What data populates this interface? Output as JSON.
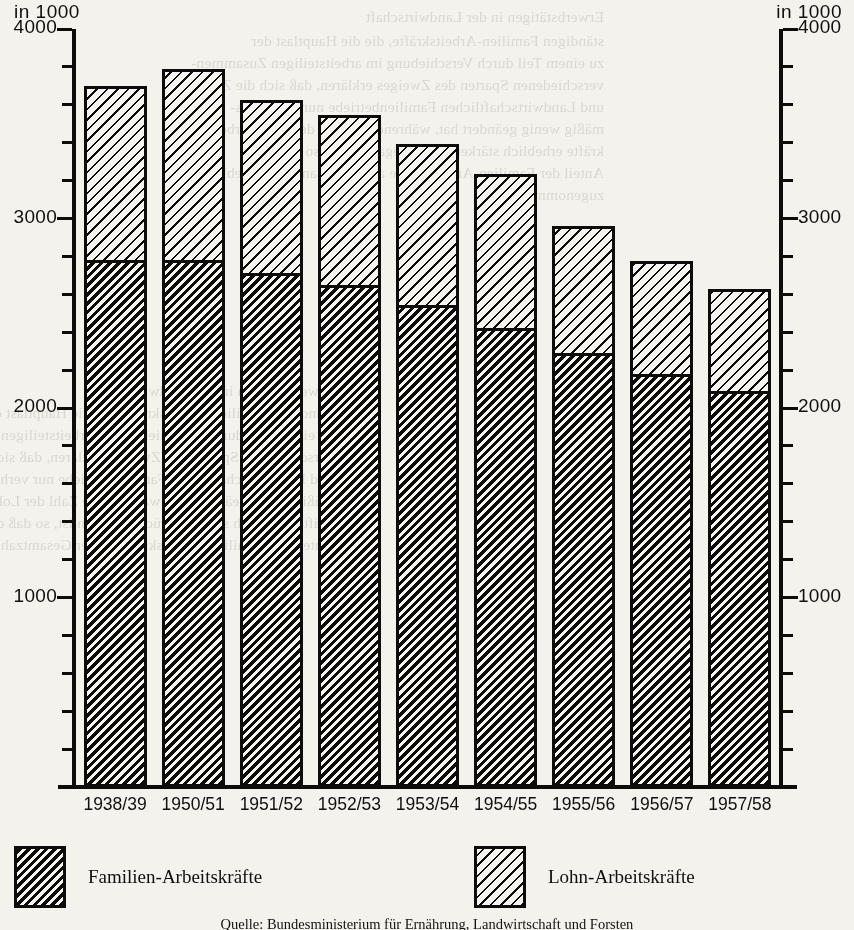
{
  "axis": {
    "unit_caption_left": "in 1000",
    "unit_caption_right": "in 1000",
    "major_ticks": [
      4000,
      3000,
      2000,
      1000
    ],
    "major_tick_labels": [
      "4000",
      "3000",
      "2000",
      "1000"
    ],
    "minor_tick_step": 200,
    "ymin": 0,
    "ymax": 4000
  },
  "legend": {
    "items": [
      {
        "label": "Familien-Arbeitskräfte",
        "pattern": "dense-dark-hatch"
      },
      {
        "label": "Lohn-Arbeitskräfte",
        "pattern": "sparse-light-hatch"
      }
    ]
  },
  "source": "Quelle: Bundesministerium für Ernährung, Landwirtschaft und Forsten",
  "chart_data": {
    "type": "bar",
    "stacked": true,
    "title": "",
    "xlabel": "",
    "ylabel": "in 1000",
    "ylim": [
      0,
      4000
    ],
    "grid": false,
    "legend_position": "bottom",
    "categories": [
      "1938/39",
      "1950/51",
      "1951/52",
      "1952/53",
      "1953/54",
      "1954/55",
      "1955/56",
      "1956/57",
      "1957/58"
    ],
    "series": [
      {
        "name": "Familien-Arbeitskräfte",
        "values": [
          2780,
          2780,
          2710,
          2650,
          2545,
          2420,
          2290,
          2180,
          2090
        ]
      },
      {
        "name": "Lohn-Arbeitskräfte",
        "values": [
          920,
          1010,
          915,
          895,
          850,
          815,
          670,
          595,
          540
        ]
      }
    ],
    "totals": [
      3700,
      3790,
      3625,
      3545,
      3395,
      3235,
      2960,
      2775,
      2630
    ]
  },
  "ghost_text": [
    "Erwerbstätigen in der Landwirtschaft",
    "ständigen Familien-Arbeitskräfte, die die Hauptlast der",
    "zu einem Teil durch Verschiebung im arbeitsteiligen Zusammen-",
    "verschiedenen Sparten des Zweiges erklären, daß sich die Zahl",
    "und Landwirtschaftlichen Familienbetriebe nur verhältnis-",
    "mäßig wenig geändert hat, während die Zahl der Lohn-Arbeits-",
    "kräfte erheblich stärker zurückgegangen ist, so daß der",
    "Anteil der Familien-Arbeitskräfte an der Gesamtzahl erheblich",
    "zugenommen hat."
  ]
}
